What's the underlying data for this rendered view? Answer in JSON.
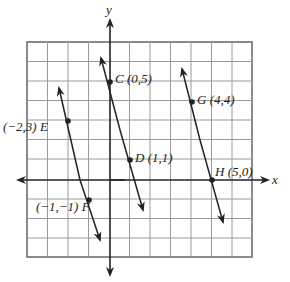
{
  "axes": {
    "x_label": "x",
    "y_label": "y",
    "x_range": [
      -4,
      7
    ],
    "y_range": [
      -4,
      7
    ]
  },
  "points": {
    "C": {
      "label": "C (0,5)",
      "x": 0,
      "y": 5
    },
    "D": {
      "label": "D (1,1)",
      "x": 1,
      "y": 1
    },
    "E": {
      "label": "(−2,3) E",
      "x": -2,
      "y": 3
    },
    "F": {
      "label": "(−1,−1) F",
      "x": -1,
      "y": -1
    },
    "G": {
      "label": "G (4,4)",
      "x": 4,
      "y": 4
    },
    "H": {
      "label": "H (5,0)",
      "x": 5,
      "y": 0
    }
  },
  "lines": [
    {
      "name": "line-EF",
      "through": [
        "E",
        "F"
      ]
    },
    {
      "name": "line-CD",
      "through": [
        "C",
        "D"
      ]
    },
    {
      "name": "line-GH",
      "through": [
        "G",
        "H"
      ]
    }
  ],
  "colors": {
    "grid": "#9a9a9a",
    "ink": "#222222"
  }
}
